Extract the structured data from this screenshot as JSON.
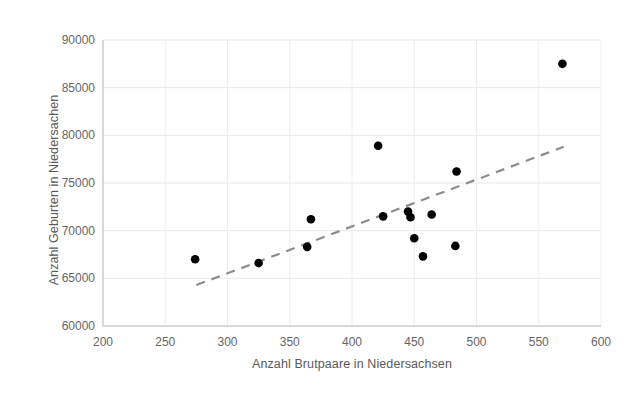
{
  "chart_data": {
    "type": "scatter",
    "title": "",
    "xlabel": "Anzahl Brutpaare in Niedersachsen",
    "ylabel": "Anzahl Geburten in Niedersachen",
    "xlim": [
      200,
      600
    ],
    "ylim": [
      60000,
      90000
    ],
    "xticks": [
      200,
      250,
      300,
      350,
      400,
      450,
      500,
      550,
      600
    ],
    "yticks": [
      60000,
      65000,
      70000,
      75000,
      80000,
      85000,
      90000
    ],
    "xtick_labels": [
      "200",
      "250",
      "300",
      "350",
      "400",
      "450",
      "500",
      "550",
      "600"
    ],
    "ytick_labels": [
      "60000",
      "65000",
      "70000",
      "75000",
      "80000",
      "85000",
      "90000"
    ],
    "grid": true,
    "legend": "none",
    "marker_color": "#000000",
    "marker_size": 7,
    "series": [
      {
        "name": "Brutpaare vs Geburten",
        "points": [
          {
            "x": 274,
            "y": 67000
          },
          {
            "x": 325,
            "y": 66600
          },
          {
            "x": 364,
            "y": 68300
          },
          {
            "x": 367,
            "y": 71200
          },
          {
            "x": 421,
            "y": 78900
          },
          {
            "x": 425,
            "y": 71500
          },
          {
            "x": 445,
            "y": 72000
          },
          {
            "x": 447,
            "y": 71400
          },
          {
            "x": 450,
            "y": 69200
          },
          {
            "x": 457,
            "y": 67300
          },
          {
            "x": 464,
            "y": 71700
          },
          {
            "x": 483,
            "y": 68400
          },
          {
            "x": 484,
            "y": 76200
          },
          {
            "x": 569,
            "y": 87500
          }
        ]
      }
    ],
    "trendline": {
      "type": "linear",
      "style": "dashed",
      "color": "#8c8c8c",
      "x_start": 275,
      "y_start": 64300,
      "x_end": 570,
      "y_end": 78800
    }
  },
  "axes": {
    "x_title": "Anzahl Brutpaare in Niedersachsen",
    "y_title": "Anzahl Geburten in Niedersachen"
  }
}
